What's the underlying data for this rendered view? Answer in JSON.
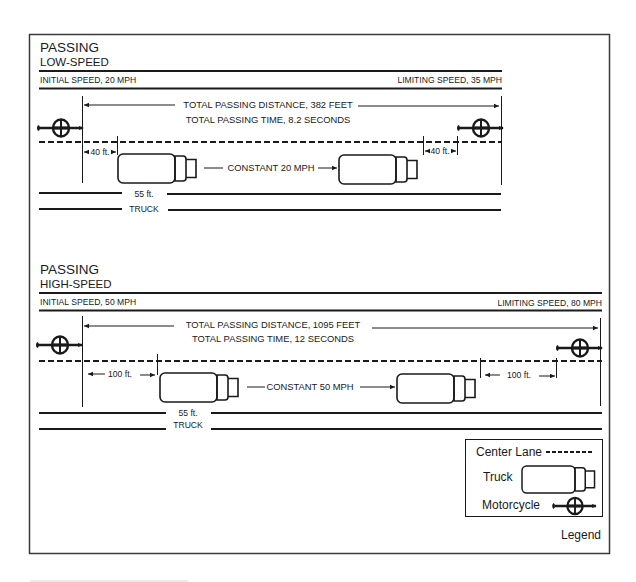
{
  "low_speed": {
    "title": "PASSING",
    "subtitle": "LOW-SPEED",
    "initial_speed": "INITIAL SPEED, 20 MPH",
    "limiting_speed": "LIMITING SPEED, 35 MPH",
    "total_distance": "TOTAL PASSING DISTANCE, 382 FEET",
    "total_time": "TOTAL PASSING TIME, 8.2 SECONDS",
    "gap_left": "40 ft.",
    "gap_right": "40 ft.",
    "constant_speed": "CONSTANT 20 MPH",
    "truck_length": "55 ft.",
    "truck_label": "TRUCK"
  },
  "high_speed": {
    "title": "PASSING",
    "subtitle": "HIGH-SPEED",
    "initial_speed": "INITIAL SPEED, 50 MPH",
    "limiting_speed": "LIMITING SPEED, 80 MPH",
    "total_distance": "TOTAL PASSING DISTANCE, 1095 FEET",
    "total_time": "TOTAL PASSING TIME, 12 SECONDS",
    "gap_left": "100 ft.",
    "gap_right": "100 ft.",
    "constant_speed": "CONSTANT 50 MPH",
    "truck_length": "55 ft.",
    "truck_label": "TRUCK"
  },
  "legend": {
    "title": "Legend",
    "items": [
      {
        "label": "Center Lane",
        "icon": "dashed-line-icon"
      },
      {
        "label": "Truck",
        "icon": "truck-icon"
      },
      {
        "label": "Motorcycle",
        "icon": "motorcycle-icon"
      }
    ]
  },
  "colors": {
    "ink": "#1a1a1a",
    "background": "#ffffff",
    "frame": "#3a3a3a"
  }
}
